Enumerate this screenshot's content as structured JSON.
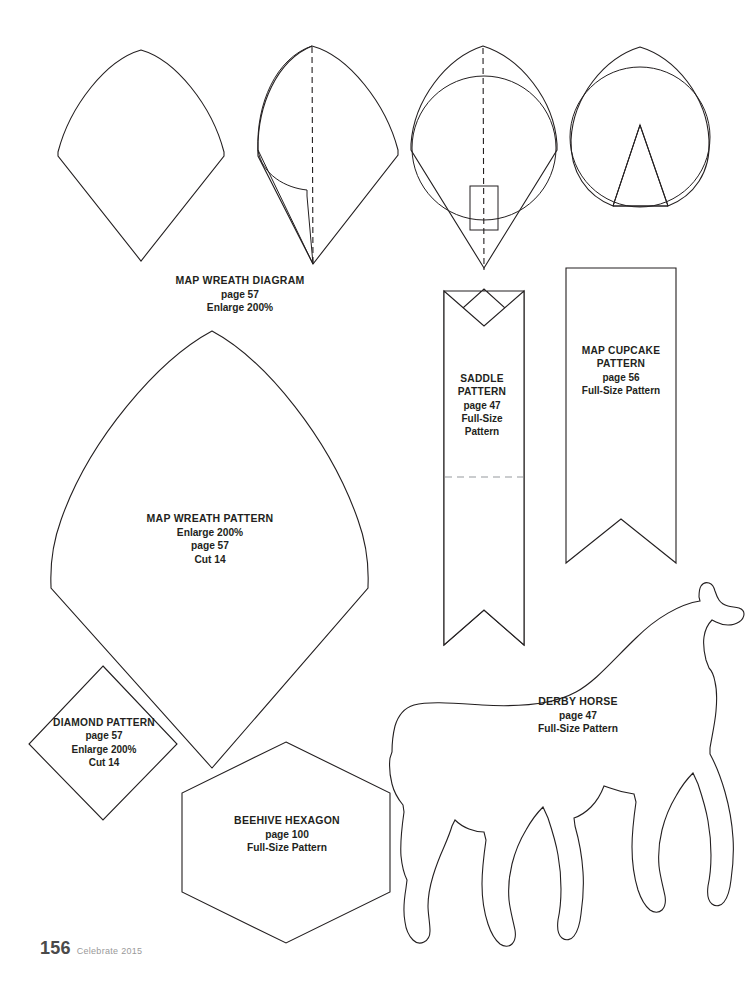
{
  "page": {
    "background_color": "#ffffff",
    "line_color": "#231f20",
    "fold_line_color": "#b9bcbe"
  },
  "labels": {
    "map_wreath_diagram": {
      "title": "MAP WREATH DIAGRAM",
      "line2": "page 57",
      "line3": "Enlarge 200%"
    },
    "map_wreath_pattern": {
      "title": "MAP WREATH PATTERN",
      "line2": "Enlarge 200%",
      "line3": "page 57",
      "line4": "Cut 14"
    },
    "diamond_pattern": {
      "title": "DIAMOND PATTERN",
      "line2": "page 57",
      "line3": "Enlarge 200%",
      "line4": "Cut 14"
    },
    "beehive_hexagon": {
      "title": "BEEHIVE HEXAGON",
      "line2": "page 100",
      "line3": "Full-Size  Pattern"
    },
    "saddle_pattern": {
      "title_line1": "SADDLE",
      "title_line2": "PATTERN",
      "line3": "page 47",
      "line4": "Full-Size",
      "line5": "Pattern"
    },
    "map_cupcake_pattern": {
      "title_line1": "MAP CUPCAKE",
      "title_line2": "PATTERN",
      "line3": "page 56",
      "line4": "Full-Size Pattern"
    },
    "derby_horse": {
      "title": "DERBY HORSE",
      "line2": "page 47",
      "line3": "Full-Size Pattern"
    }
  },
  "footer": {
    "page_number": "156",
    "issue": "Celebrate 2015"
  },
  "shapes": [
    {
      "name": "map-wreath-kite-step1",
      "type": "kite-petal"
    },
    {
      "name": "map-wreath-kite-step2",
      "type": "kite-petal-folded"
    },
    {
      "name": "map-wreath-kite-step3",
      "type": "cone-with-tab"
    },
    {
      "name": "map-wreath-kite-step4",
      "type": "circle-with-crown"
    },
    {
      "name": "map-wreath-pattern-shape",
      "type": "pointed-oval"
    },
    {
      "name": "saddle-banner",
      "type": "double-notched-banner"
    },
    {
      "name": "map-cupcake-banner",
      "type": "bottom-notched-banner"
    },
    {
      "name": "diamond-shape",
      "type": "diamond"
    },
    {
      "name": "beehive-hexagon-shape",
      "type": "hexagon"
    },
    {
      "name": "derby-horse-silhouette",
      "type": "horse-outline"
    }
  ]
}
